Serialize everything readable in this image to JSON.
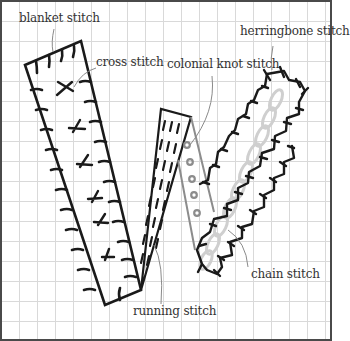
{
  "diagram": {
    "type": "embroidery stitch reference illustration",
    "colors": {
      "stitch_black": "#1a1a1a",
      "colonial_gray": "#8c8c8c",
      "chain_gray": "#cfcfcf",
      "leader_line": "#8a8a8a",
      "grid": "#d9d9d9",
      "border": "#4a4a4a"
    },
    "labels": {
      "blanket": "blanket stitch",
      "cross": "cross stitch",
      "colonial": "colonial knot stitch",
      "herringbone": "herringbone stitch",
      "chain": "chain stitch",
      "running": "running stitch"
    }
  }
}
